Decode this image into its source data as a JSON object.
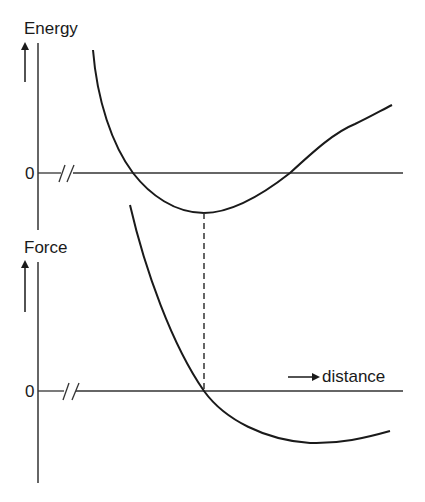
{
  "diagram": {
    "panels": [
      {
        "id": "energy",
        "y_label": "Energy",
        "zero_label": "0",
        "curve": "potential energy well: decreases steeply, crosses zero, reaches minimum, rises and crosses zero again, continues upward"
      },
      {
        "id": "force",
        "y_label": "Force",
        "zero_label": "0",
        "curve": "force decreases steeply, crosses zero directly below energy minimum, reaches negative minimum, rises slightly"
      }
    ],
    "x_label": "distance",
    "annotation": "dashed vertical line linking energy minimum to force zero crossing",
    "colors": {
      "line": "#1a1a1a",
      "axis": "#333333"
    }
  }
}
